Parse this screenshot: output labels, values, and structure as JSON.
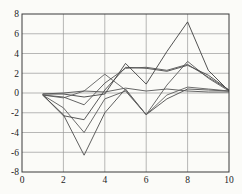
{
  "figure": {
    "background_color": "#fbfbf8",
    "axis_box_color": "#3a3a3a",
    "grid_color": "#9a9a9a",
    "tick_label_color": "#1c1c1c",
    "plot_rect": {
      "left": 22,
      "top": 14,
      "width": 207,
      "height": 158
    }
  },
  "chart_data": {
    "type": "line",
    "title": "",
    "xlabel": "",
    "ylabel": "",
    "xlim": [
      0,
      10
    ],
    "ylim": [
      -8,
      8
    ],
    "xticks": [
      0,
      2,
      4,
      6,
      8,
      10
    ],
    "yticks": [
      8,
      6,
      4,
      2,
      0,
      -2,
      -4,
      -6,
      -8
    ],
    "grid": true,
    "legend": "none",
    "x": [
      1,
      2,
      3,
      4,
      5,
      6,
      7,
      8,
      9,
      10
    ],
    "series": [
      {
        "name": "series-1",
        "color": "#4d4d4d",
        "values": [
          -0.2,
          -2.2,
          -6.3,
          -2.0,
          0.4,
          -2.2,
          -0.6,
          0.4,
          0.3,
          0.2
        ]
      },
      {
        "name": "series-2",
        "color": "#5a5a5a",
        "values": [
          -0.2,
          -1.5,
          -4.0,
          -0.6,
          0.2,
          -2.2,
          0.8,
          3.2,
          1.5,
          0.2
        ]
      },
      {
        "name": "series-3",
        "color": "#474747",
        "values": [
          -0.2,
          -2.3,
          -2.7,
          0.3,
          2.6,
          2.5,
          2.2,
          2.8,
          1.8,
          0.3
        ]
      },
      {
        "name": "series-4",
        "color": "#3f3f3f",
        "values": [
          -0.1,
          -0.1,
          -0.4,
          -0.1,
          3.0,
          0.9,
          4.2,
          7.2,
          2.3,
          0.2
        ]
      },
      {
        "name": "series-5",
        "color": "#606060",
        "values": [
          -0.2,
          -0.5,
          0.2,
          1.9,
          0.3,
          -2.2,
          -0.2,
          0.6,
          0.4,
          0.2
        ]
      },
      {
        "name": "series-6",
        "color": "#555555",
        "values": [
          -0.1,
          0.0,
          0.2,
          0.1,
          0.5,
          0.2,
          0.4,
          0.2,
          0.1,
          0.1
        ]
      },
      {
        "name": "series-7",
        "color": "#525252",
        "values": [
          -0.2,
          -0.4,
          -1.2,
          1.0,
          2.5,
          2.6,
          2.3,
          2.9,
          1.6,
          0.3
        ]
      }
    ]
  }
}
